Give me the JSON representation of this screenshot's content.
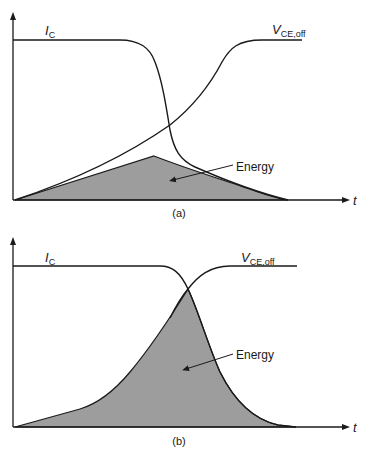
{
  "figure": {
    "panels": [
      {
        "id": "a",
        "caption": "(a)",
        "current_label": "I",
        "current_sub": "C",
        "voltage_label": "V",
        "voltage_sub": "CE,off",
        "area_label": "Energy",
        "time_axis_label": "t"
      },
      {
        "id": "b",
        "caption": "(b)",
        "current_label": "I",
        "current_sub": "C",
        "voltage_label": "V",
        "voltage_sub": "CE,off",
        "area_label": "Energy",
        "time_axis_label": "t"
      }
    ],
    "colors": {
      "line": "#1a1a1a",
      "fill": "#9d9d9d",
      "background": "#ffffff"
    }
  }
}
